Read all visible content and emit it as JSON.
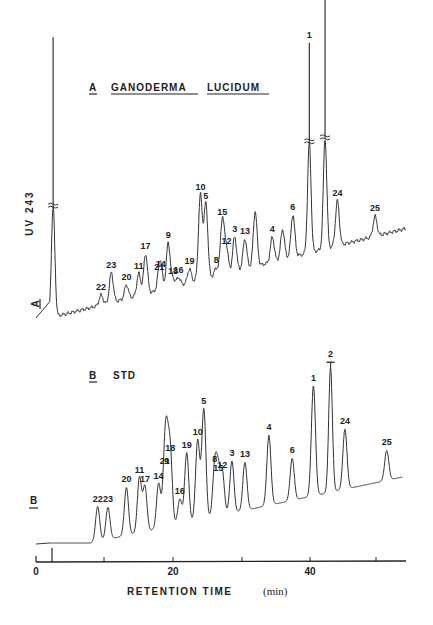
{
  "chart_data": [
    {
      "type": "line",
      "panel": "A",
      "title": "A GANODERMA LUCIDUM",
      "ylabel": "UV 243",
      "xlabel": "RETENTION TIME (min)",
      "xlim": [
        0,
        54
      ],
      "x_ticks": [
        0,
        10,
        20,
        30,
        40,
        50
      ],
      "x_tick_labels": [
        "0",
        "",
        "20",
        "",
        "40",
        ""
      ],
      "grid": false,
      "notes": "Solvent front peak at ~2.5 min and peaks 1, 2 are off-scale (broken-axis marks).",
      "peaks": [
        {
          "label": "solvent",
          "t": 2.5,
          "height": 280,
          "truncated": true
        },
        {
          "label": "22",
          "t": 9.5,
          "height": 10
        },
        {
          "label": "23",
          "t": 11.0,
          "height": 30
        },
        {
          "label": "20",
          "t": 13.2,
          "height": 14
        },
        {
          "label": "11",
          "t": 15.0,
          "height": 22
        },
        {
          "label": "17",
          "t": 16.0,
          "height": 40
        },
        {
          "label": "21",
          "t": 18.0,
          "height": 15
        },
        {
          "label": "14",
          "t": 18.2,
          "height": 18
        },
        {
          "label": "9",
          "t": 19.3,
          "height": 45
        },
        {
          "label": "18",
          "t": 20.0,
          "height": 8
        },
        {
          "label": "16",
          "t": 20.8,
          "height": 8
        },
        {
          "label": "19",
          "t": 22.4,
          "height": 14
        },
        {
          "label": "10",
          "t": 24.0,
          "height": 85
        },
        {
          "label": "5",
          "t": 24.8,
          "height": 75
        },
        {
          "label": "8",
          "t": 26.3,
          "height": 8
        },
        {
          "label": "15",
          "t": 27.2,
          "height": 55
        },
        {
          "label": "12",
          "t": 27.8,
          "height": 25
        },
        {
          "label": "3",
          "t": 29.0,
          "height": 35
        },
        {
          "label": "13",
          "t": 30.5,
          "height": 30
        },
        {
          "label": "",
          "t": 32.0,
          "height": 55
        },
        {
          "label": "4",
          "t": 34.5,
          "height": 25
        },
        {
          "label": "",
          "t": 36.0,
          "height": 30
        },
        {
          "label": "6",
          "t": 37.5,
          "height": 42
        },
        {
          "label": "1",
          "t": 39.9,
          "height": 210,
          "truncated": true
        },
        {
          "label": "2",
          "t": 42.2,
          "height": 360,
          "truncated": true
        },
        {
          "label": "24",
          "t": 44.0,
          "height": 45
        },
        {
          "label": "25",
          "t": 49.5,
          "height": 20
        }
      ]
    },
    {
      "type": "line",
      "panel": "B",
      "title": "B STD",
      "xlabel": "RETENTION TIME (min)",
      "xlim": [
        0,
        54
      ],
      "x_ticks": [
        0,
        10,
        20,
        30,
        40,
        50
      ],
      "x_tick_labels": [
        "0",
        "",
        "20",
        "",
        "40",
        ""
      ],
      "grid": false,
      "notes": "Peak 2 is off-scale (capped).",
      "peaks": [
        {
          "label": "22",
          "t": 9.0,
          "height": 35
        },
        {
          "label": "23",
          "t": 10.5,
          "height": 32
        },
        {
          "label": "20",
          "t": 13.2,
          "height": 48
        },
        {
          "label": "11",
          "t": 15.1,
          "height": 55
        },
        {
          "label": "17",
          "t": 15.9,
          "height": 45
        },
        {
          "label": "14",
          "t": 17.9,
          "height": 45
        },
        {
          "label": "21",
          "t": 18.8,
          "height": 58
        },
        {
          "label": "9",
          "t": 19.1,
          "height": 58
        },
        {
          "label": "18",
          "t": 19.6,
          "height": 70
        },
        {
          "label": "16",
          "t": 21.0,
          "height": 25
        },
        {
          "label": "19",
          "t": 22.0,
          "height": 70
        },
        {
          "label": "10",
          "t": 23.6,
          "height": 80
        },
        {
          "label": "5",
          "t": 24.5,
          "height": 110
        },
        {
          "label": "8",
          "t": 26.1,
          "height": 50
        },
        {
          "label": "15",
          "t": 26.6,
          "height": 40
        },
        {
          "label": "12",
          "t": 27.2,
          "height": 42
        },
        {
          "label": "3",
          "t": 28.6,
          "height": 52
        },
        {
          "label": "13",
          "t": 30.5,
          "height": 48
        },
        {
          "label": "4",
          "t": 34.0,
          "height": 70
        },
        {
          "label": "6",
          "t": 37.4,
          "height": 42
        },
        {
          "label": "1",
          "t": 40.5,
          "height": 110
        },
        {
          "label": "2",
          "t": 43.0,
          "height": 130,
          "truncated": true
        },
        {
          "label": "24",
          "t": 45.1,
          "height": 60
        },
        {
          "label": "25",
          "t": 51.2,
          "height": 30
        }
      ]
    }
  ],
  "figure": {
    "panel_a_title_letter": "A",
    "panel_a_title_words": [
      "GANODERMA",
      "LUCIDUM"
    ],
    "panel_b_title_letter": "B",
    "panel_b_title_word": "STD",
    "y_axis_label": "UV 243",
    "panel_a_marker": "A",
    "panel_b_marker": "B",
    "x_axis_title": "RETENTION TIME",
    "x_axis_unit": "(min)",
    "x_tick_labels": [
      "0",
      "20",
      "40"
    ]
  }
}
